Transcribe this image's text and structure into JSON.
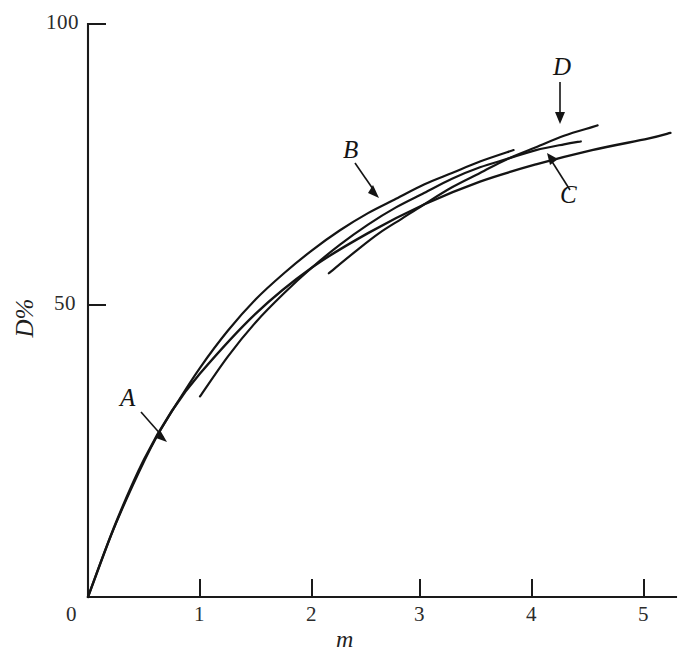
{
  "figure": {
    "background_color": "#ffffff",
    "ink_color": "#141414"
  },
  "axes": {
    "y_title": "D%",
    "x_title": "m",
    "x_ticks": [
      "0",
      "1",
      "2",
      "3",
      "4",
      "5"
    ],
    "y_ticks": [
      "0",
      "50",
      "100"
    ]
  },
  "curve_labels": {
    "a": "A",
    "b": "B",
    "c": "C",
    "d": "D"
  },
  "chart_data": {
    "type": "line",
    "title": "",
    "subtitle": "",
    "xlabel": "m",
    "ylabel": "D%",
    "xlim": [
      0,
      5.25
    ],
    "ylim": [
      0,
      100
    ],
    "xticks": [
      0,
      1,
      2,
      3,
      4,
      5
    ],
    "yticks": [
      0,
      50,
      100
    ],
    "grid": false,
    "legend": "inline-labels-with-arrows",
    "annotations": [
      {
        "text": "A",
        "label_xy": [
          0.38,
          37.5
        ],
        "points_to_xy": [
          0.66,
          31.0
        ]
      },
      {
        "text": "B",
        "label_xy": [
          2.36,
          76.5
        ],
        "points_to_xy": [
          2.57,
          69.5
        ]
      },
      {
        "text": "C",
        "label_xy": [
          4.29,
          68.5
        ],
        "points_to_xy": [
          4.15,
          76.0
        ]
      },
      {
        "text": "D",
        "label_xy": [
          4.21,
          90.0
        ],
        "points_to_xy": [
          4.21,
          81.5
        ]
      }
    ],
    "series": [
      {
        "name": "A",
        "x": [
          0,
          0.2,
          0.4,
          0.6,
          0.8,
          1.0,
          1.25,
          1.5,
          1.75,
          2.0,
          2.25,
          2.5,
          2.75,
          3.0,
          3.25,
          3.5,
          3.8
        ],
        "y": [
          0,
          10.5,
          19.5,
          27.5,
          34.0,
          40.0,
          46.5,
          52.0,
          56.5,
          60.5,
          64.0,
          67.0,
          69.5,
          72.0,
          74.0,
          76.0,
          78.0
        ]
      },
      {
        "name": "B",
        "x": [
          1.0,
          1.25,
          1.5,
          1.75,
          2.0,
          2.25,
          2.5,
          2.75,
          3.0,
          3.25,
          3.5,
          3.75,
          4.0,
          4.25,
          4.4
        ],
        "y": [
          35.0,
          42.0,
          48.0,
          53.0,
          57.5,
          61.5,
          65.0,
          68.0,
          70.5,
          73.0,
          75.0,
          76.5,
          78.0,
          79.0,
          79.5
        ]
      },
      {
        "name": "C",
        "x": [
          0,
          0.25,
          0.5,
          0.75,
          1.0,
          1.5,
          2.0,
          2.5,
          3.0,
          3.5,
          4.0,
          4.5,
          5.0,
          5.2
        ],
        "y": [
          0,
          13.0,
          24.0,
          32.5,
          39.0,
          49.5,
          57.5,
          63.5,
          68.5,
          72.5,
          75.5,
          78.0,
          80.0,
          81.0
        ]
      },
      {
        "name": "D",
        "x": [
          2.15,
          2.4,
          2.6,
          2.8,
          3.0,
          3.25,
          3.5,
          3.75,
          4.0,
          4.25,
          4.5,
          4.55
        ],
        "y": [
          56.5,
          60.5,
          63.5,
          66.0,
          68.5,
          71.5,
          74.0,
          76.5,
          78.5,
          80.5,
          82.0,
          82.3
        ]
      }
    ]
  }
}
